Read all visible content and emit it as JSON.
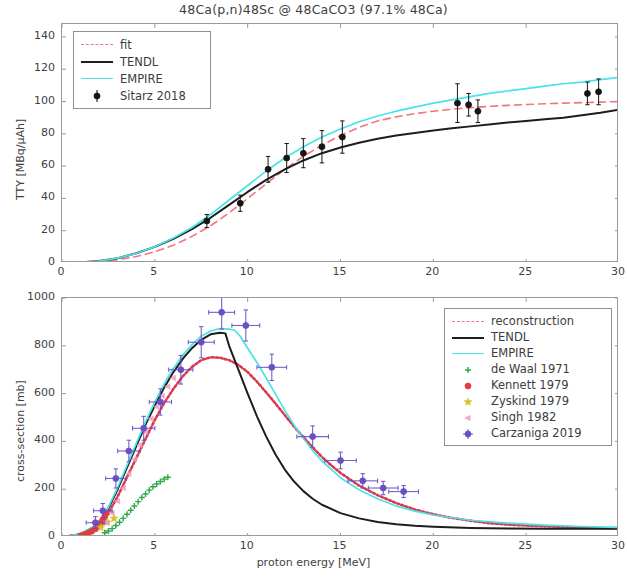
{
  "title": "48Ca(p,n)48Sc @ 48CaCO3 (97.1% 48Ca)",
  "xlabel": "proton energy [MeV]",
  "panels": {
    "top": {
      "ylabel": "TTY [MBq/μAh]",
      "legend": [
        {
          "label": "fit",
          "key": "dash-red"
        },
        {
          "label": "TENDL",
          "key": "solid-black"
        },
        {
          "label": "EMPIRE",
          "key": "solid-cyan"
        },
        {
          "label": "Sitarz 2018",
          "key": "errorbar-black"
        }
      ]
    },
    "bottom": {
      "ylabel": "cross-section [mb]",
      "legend": [
        {
          "label": "reconstruction",
          "key": "dash-red"
        },
        {
          "label": "TENDL",
          "key": "solid-black"
        },
        {
          "label": "EMPIRE",
          "key": "solid-cyan"
        },
        {
          "label": "de Waal 1971",
          "key": "marker-green-plus"
        },
        {
          "label": "Kennett 1979",
          "key": "marker-red-dot"
        },
        {
          "label": "Zyskind 1979",
          "key": "marker-yellow-star"
        },
        {
          "label": "Singh 1982",
          "key": "marker-pink-triangle"
        },
        {
          "label": "Carzaniga 2019",
          "key": "marker-purple-dot"
        }
      ]
    }
  },
  "ticks": {
    "x": [
      0,
      5,
      10,
      15,
      20,
      25,
      30
    ],
    "y_top": [
      0,
      20,
      40,
      60,
      80,
      100,
      120,
      140
    ],
    "y_bottom": [
      0,
      200,
      400,
      600,
      800,
      1000
    ]
  },
  "chart_data": [
    {
      "type": "line",
      "panel": "top",
      "title": "48Ca(p,n)48Sc @ 48CaCO3 (97.1% 48Ca)",
      "xlabel": "proton energy [MeV]",
      "ylabel": "TTY [MBq/μAh]",
      "xlim": [
        0,
        30
      ],
      "ylim": [
        0,
        148
      ],
      "grid": false,
      "legend_position": "upper left",
      "series": [
        {
          "name": "fit",
          "style": "dashed",
          "color": "#f2757f",
          "x": [
            0,
            1,
            2,
            3,
            4,
            5,
            6,
            7,
            8,
            9,
            10,
            11,
            12,
            13,
            14,
            15,
            16,
            17,
            18,
            19,
            20,
            21,
            22,
            23,
            24,
            25,
            26,
            27,
            28,
            29,
            30
          ],
          "y": [
            0,
            0.3,
            0.9,
            2,
            4,
            7,
            11,
            16.5,
            23,
            31,
            40,
            49,
            58,
            66,
            73,
            79,
            84,
            88,
            90.5,
            92.5,
            94,
            95.2,
            96.2,
            97,
            97.6,
            98.1,
            98.6,
            99,
            99.3,
            99.6,
            100
          ]
        },
        {
          "name": "TENDL",
          "style": "solid",
          "color": "#1d1d1d",
          "x": [
            0,
            1,
            2,
            3,
            4,
            5,
            6,
            7,
            8,
            9,
            10,
            11,
            12,
            13,
            14,
            15,
            16,
            17,
            18,
            19,
            20,
            21,
            22,
            23,
            24,
            25,
            26,
            27,
            28,
            29,
            30
          ],
          "y": [
            0,
            0.4,
            1.2,
            3,
            6,
            10,
            15,
            21,
            28,
            36,
            44,
            51.5,
            58,
            63.5,
            68,
            71.5,
            74.5,
            77,
            79,
            80.5,
            82,
            83.4,
            84.6,
            85.8,
            87,
            88,
            89,
            90,
            91.5,
            93,
            95
          ]
        },
        {
          "name": "EMPIRE",
          "style": "solid",
          "color": "#49e3e8",
          "x": [
            0,
            1,
            2,
            3,
            4,
            5,
            6,
            7,
            8,
            9,
            10,
            11,
            12,
            13,
            14,
            15,
            16,
            17,
            18,
            19,
            20,
            21,
            22,
            23,
            24,
            25,
            26,
            27,
            28,
            29,
            30
          ],
          "y": [
            0,
            0.4,
            1.2,
            3,
            6,
            10,
            15.5,
            22,
            30,
            39,
            48,
            57,
            65,
            72,
            78,
            83,
            87.5,
            91,
            94,
            96.5,
            99,
            101,
            103,
            105,
            106.5,
            108,
            109.5,
            111,
            112,
            113.5,
            115
          ]
        },
        {
          "name": "Sitarz 2018",
          "style": "errorbar",
          "color": "#151515",
          "x": [
            7.8,
            9.6,
            11.1,
            12.1,
            13.0,
            14.0,
            15.1,
            21.3,
            21.9,
            22.4,
            28.3,
            28.9
          ],
          "y": [
            26,
            37,
            58,
            65,
            68,
            72,
            78,
            99,
            98,
            94,
            105,
            106
          ],
          "yerr": [
            4,
            5,
            8,
            9,
            9,
            10,
            10,
            12,
            7,
            7,
            7,
            8
          ]
        }
      ]
    },
    {
      "type": "line",
      "panel": "bottom",
      "xlabel": "proton energy [MeV]",
      "ylabel": "cross-section [mb]",
      "xlim": [
        0,
        30
      ],
      "ylim": [
        0,
        1000
      ],
      "grid": false,
      "legend_position": "upper right",
      "series": [
        {
          "name": "reconstruction",
          "style": "dashed",
          "color": "#d63b4e",
          "x": [
            0,
            1,
            2,
            2.5,
            3,
            3.5,
            4,
            4.5,
            5,
            5.5,
            6,
            6.5,
            7,
            7.5,
            8,
            8.5,
            9,
            9.5,
            10,
            10.5,
            11,
            11.5,
            12,
            12.5,
            13,
            13.5,
            14,
            14.5,
            15,
            16,
            17,
            18,
            19,
            20,
            21,
            22,
            23,
            24,
            25,
            26,
            27,
            28,
            29,
            30
          ],
          "y": [
            0,
            10,
            45,
            100,
            170,
            250,
            330,
            410,
            490,
            560,
            620,
            672,
            712,
            740,
            752,
            750,
            740,
            720,
            690,
            650,
            605,
            558,
            510,
            462,
            418,
            375,
            335,
            300,
            268,
            215,
            175,
            142,
            115,
            95,
            80,
            68,
            58,
            52,
            48,
            45,
            42,
            40,
            38,
            37
          ]
        },
        {
          "name": "TENDL",
          "style": "solid",
          "color": "#1d1d1d",
          "x": [
            0,
            1,
            2,
            2.5,
            3,
            3.5,
            4,
            4.5,
            5,
            5.5,
            6,
            6.5,
            7,
            7.5,
            8,
            8.5,
            8.8,
            9,
            9.5,
            10,
            10.5,
            11,
            11.5,
            12,
            12.5,
            13,
            13.5,
            14,
            15,
            16,
            17,
            18,
            19,
            20,
            22,
            24,
            26,
            28,
            30
          ],
          "y": [
            0,
            12,
            55,
            120,
            200,
            290,
            380,
            470,
            550,
            625,
            690,
            745,
            790,
            825,
            848,
            855,
            852,
            800,
            700,
            600,
            505,
            420,
            345,
            282,
            232,
            192,
            160,
            135,
            100,
            78,
            63,
            53,
            47,
            43,
            38,
            36,
            35,
            34,
            34
          ]
        },
        {
          "name": "EMPIRE",
          "style": "solid",
          "color": "#49e3e8",
          "x": [
            0,
            1,
            2,
            2.5,
            3,
            3.5,
            4,
            4.5,
            5,
            5.5,
            6,
            6.5,
            7,
            7.5,
            8,
            8.5,
            9,
            9.3,
            9.6,
            10,
            10.5,
            11,
            11.5,
            12,
            12.5,
            13,
            13.5,
            14,
            15,
            16,
            17,
            18,
            19,
            20,
            22,
            24,
            26,
            28,
            30
          ],
          "y": [
            0,
            14,
            58,
            125,
            208,
            300,
            392,
            482,
            565,
            640,
            705,
            760,
            805,
            840,
            862,
            872,
            870,
            865,
            840,
            790,
            730,
            665,
            598,
            530,
            468,
            412,
            362,
            318,
            248,
            198,
            160,
            130,
            108,
            92,
            70,
            58,
            50,
            44,
            40
          ]
        },
        {
          "name": "de Waal 1971",
          "style": "marker",
          "marker": "plus",
          "color": "#2fa84a",
          "x": [
            2.3,
            2.5,
            2.7,
            2.9,
            3.1,
            3.3,
            3.5,
            3.7,
            3.9,
            4.1,
            4.3,
            4.5,
            4.7,
            4.9,
            5.1,
            5.3,
            5.5,
            5.7
          ],
          "y": [
            18,
            25,
            35,
            48,
            62,
            78,
            95,
            112,
            130,
            148,
            165,
            180,
            196,
            210,
            222,
            232,
            242,
            250
          ]
        },
        {
          "name": "Kennett 1979",
          "style": "marker",
          "marker": "dot",
          "color": "#e23c3c",
          "x": [
            1.0,
            1.2,
            1.4,
            1.6,
            1.8,
            2.0,
            2.1,
            2.2,
            2.3,
            2.4
          ],
          "y": [
            5,
            10,
            16,
            24,
            34,
            48,
            60,
            72,
            85,
            100
          ]
        },
        {
          "name": "Zyskind 1979",
          "style": "marker",
          "marker": "star",
          "color": "#d7c327",
          "x": [
            2.1,
            2.45,
            2.8
          ],
          "y": [
            40,
            62,
            78
          ]
        },
        {
          "name": "Singh 1982",
          "style": "marker",
          "marker": "triangle",
          "color": "#f49ac1",
          "x": [
            2.4,
            2.7,
            3.0,
            3.3,
            3.6,
            3.9,
            4.2,
            4.5,
            4.8,
            5.1,
            5.4,
            5.7,
            6.0
          ],
          "y": [
            60,
            100,
            150,
            205,
            265,
            325,
            385,
            440,
            495,
            545,
            590,
            630,
            665
          ]
        },
        {
          "name": "Carzaniga 2019",
          "style": "errorbar",
          "marker": "dot",
          "color": "#6a4fc4",
          "x": [
            1.8,
            2.2,
            2.9,
            3.6,
            4.4,
            5.3,
            6.4,
            7.5,
            8.6,
            9.9,
            11.3,
            13.5,
            15.0,
            16.2,
            17.3,
            18.4
          ],
          "y": [
            60,
            110,
            245,
            360,
            455,
            565,
            700,
            815,
            940,
            885,
            710,
            420,
            320,
            235,
            205,
            190
          ],
          "xerr": [
            0.5,
            0.5,
            0.55,
            0.6,
            0.6,
            0.6,
            0.65,
            0.7,
            0.7,
            0.75,
            0.8,
            0.85,
            0.85,
            0.8,
            0.8,
            0.8
          ],
          "yerr": [
            25,
            30,
            40,
            45,
            50,
            55,
            60,
            65,
            70,
            65,
            55,
            45,
            35,
            30,
            28,
            25
          ]
        }
      ]
    }
  ]
}
